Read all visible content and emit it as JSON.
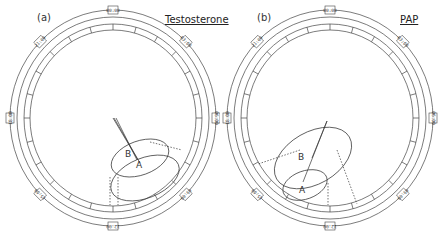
{
  "panels": [
    {
      "tag": "(a)",
      "title": "Testosterone",
      "clock_labels": [
        "00:00",
        "03:00",
        "06:00",
        "09:00",
        "12:00",
        "15:00",
        "18:00",
        "21:00"
      ],
      "points": {
        "A": "A",
        "B": "B"
      }
    },
    {
      "tag": "(b)",
      "title": "PAP",
      "clock_labels": [
        "00:00",
        "03:00",
        "06:00",
        "09:00",
        "12:00",
        "15:00",
        "18:00",
        "21:00"
      ],
      "points": {
        "A": "A",
        "B": "B"
      }
    }
  ],
  "colors": {
    "line": "#333333",
    "background": "#ffffff"
  }
}
